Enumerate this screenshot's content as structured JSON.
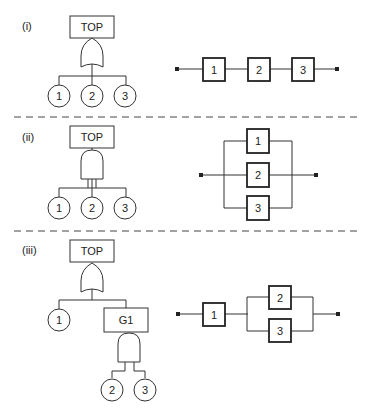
{
  "panels": [
    {
      "label": "(i)",
      "fault_tree": {
        "top_label": "TOP",
        "gate": "OR",
        "events": [
          "1",
          "2",
          "3"
        ]
      },
      "block_diagram": {
        "type": "series",
        "blocks": [
          "1",
          "2",
          "3"
        ]
      }
    },
    {
      "label": "(ii)",
      "fault_tree": {
        "top_label": "TOP",
        "gate": "AND",
        "events": [
          "1",
          "2",
          "3"
        ]
      },
      "block_diagram": {
        "type": "parallel",
        "blocks": [
          "1",
          "2",
          "3"
        ]
      }
    },
    {
      "label": "(iii)",
      "fault_tree": {
        "top_label": "TOP",
        "gate": "OR",
        "events": [
          "1"
        ],
        "subgate_label": "G1",
        "subgate": "AND",
        "subevents": [
          "2",
          "3"
        ]
      },
      "block_diagram": {
        "type": "series-parallel",
        "series_block": "1",
        "parallel_blocks": [
          "2",
          "3"
        ]
      }
    }
  ]
}
